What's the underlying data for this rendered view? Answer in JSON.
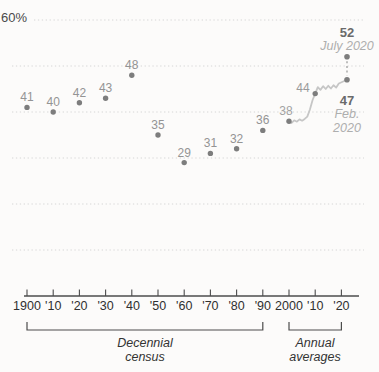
{
  "colors": {
    "background": "#fcfbfa",
    "gridline": "#d6d6d6",
    "axis": "#4c4c4c",
    "tick_label": "#303030",
    "dot": "#7d7d7d",
    "dot_label": "#949494",
    "line": "#c6c6c6",
    "dash": "#9e9e9e",
    "value_bold": "#6a6a6a",
    "date_label": "#aeaeae"
  },
  "chart_data": {
    "type": "scatter",
    "y_axis": {
      "top_label": "60%",
      "min": 0,
      "max": 60,
      "gridlines": [
        10,
        20,
        30,
        40,
        50,
        60
      ],
      "gridline_style": "dotted"
    },
    "x_axis": {
      "ticks": [
        {
          "year": 1900,
          "label": "1900"
        },
        {
          "year": 1910,
          "label": "'10"
        },
        {
          "year": 1920,
          "label": "'20"
        },
        {
          "year": 1930,
          "label": "'30"
        },
        {
          "year": 1940,
          "label": "'40"
        },
        {
          "year": 1950,
          "label": "'50"
        },
        {
          "year": 1960,
          "label": "'60"
        },
        {
          "year": 1970,
          "label": "'70"
        },
        {
          "year": 1980,
          "label": "'80"
        },
        {
          "year": 1990,
          "label": "'90"
        },
        {
          "year": 2000,
          "label": "2000"
        },
        {
          "year": 2010,
          "label": "'10"
        },
        {
          "year": 2020,
          "label": "'20"
        }
      ]
    },
    "census": {
      "group_label": "Decennial census",
      "points": [
        {
          "year": 1900,
          "value": 41
        },
        {
          "year": 1910,
          "value": 40
        },
        {
          "year": 1920,
          "value": 42
        },
        {
          "year": 1930,
          "value": 43
        },
        {
          "year": 1940,
          "value": 48
        },
        {
          "year": 1950,
          "value": 35
        },
        {
          "year": 1960,
          "value": 29
        },
        {
          "year": 1970,
          "value": 31
        },
        {
          "year": 1980,
          "value": 32
        },
        {
          "year": 1990,
          "value": 36
        }
      ]
    },
    "annual": {
      "group_label": "Annual averages",
      "line": [
        [
          2000,
          38
        ],
        [
          2001,
          37.6
        ],
        [
          2002,
          38.2
        ],
        [
          2003,
          37.9
        ],
        [
          2004,
          38.4
        ],
        [
          2005,
          38.1
        ],
        [
          2006,
          38.5
        ],
        [
          2007,
          39
        ],
        [
          2008,
          40.6
        ],
        [
          2009,
          42.6
        ],
        [
          2010,
          44
        ],
        [
          2011,
          45.4
        ],
        [
          2012,
          44.8
        ],
        [
          2013,
          45.6
        ],
        [
          2014,
          45
        ],
        [
          2015,
          45.7
        ],
        [
          2016,
          45.1
        ],
        [
          2017,
          45.8
        ],
        [
          2018,
          45.3
        ],
        [
          2019,
          46.2
        ]
      ],
      "labeled_points": [
        {
          "year": 2000,
          "value": 38,
          "label": "38"
        },
        {
          "year": 2010,
          "value": 44,
          "label": "44"
        }
      ],
      "feb_2020": {
        "value": 47,
        "label": "47",
        "date_label": "Feb. 2020"
      },
      "july_2020": {
        "value": 52,
        "label": "52",
        "date_label": "July 2020"
      }
    },
    "group_brackets": [
      {
        "label": "Decennial census",
        "from_year": 1900,
        "to_year": 1990
      },
      {
        "label": "Annual averages",
        "from_year": 2000,
        "to_year": 2020
      }
    ]
  }
}
